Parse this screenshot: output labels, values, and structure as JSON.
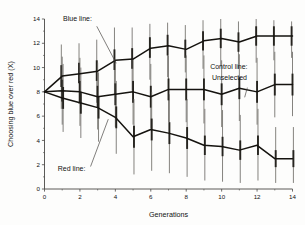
{
  "chart_data": {
    "type": "line",
    "title": "",
    "xlabel": "Generations",
    "ylabel": "Choosing blue over red (X)",
    "xlim": [
      0,
      14
    ],
    "ylim": [
      0,
      14
    ],
    "xticks": [
      0,
      2,
      4,
      6,
      8,
      10,
      12,
      14
    ],
    "yticks": [
      0,
      2,
      4,
      6,
      8,
      10,
      12,
      14
    ],
    "xtick_labels": [
      "0",
      "2",
      "4",
      "6",
      "8",
      "10",
      "12",
      "14"
    ],
    "ytick_labels": [
      "0",
      "2",
      "4",
      "6",
      "8",
      "10",
      "12",
      "14"
    ],
    "grid": false,
    "legend_position": "none",
    "x": [
      0,
      1,
      2,
      3,
      4,
      5,
      6,
      7,
      8,
      9,
      10,
      11,
      12,
      13,
      14
    ],
    "series": [
      {
        "name": "Blue line",
        "values": [
          8.0,
          9.3,
          9.5,
          9.7,
          10.6,
          10.7,
          11.6,
          11.8,
          11.5,
          12.2,
          12.4,
          12.1,
          12.6,
          12.6,
          12.6
        ],
        "err_lo": [
          8.0,
          6.6,
          7.0,
          7.1,
          7.8,
          8.1,
          9.0,
          9.2,
          9.6,
          9.9,
          10.1,
          9.9,
          10.4,
          10.6,
          10.8
        ],
        "err_hi": [
          8.0,
          11.9,
          12.0,
          12.3,
          13.3,
          13.3,
          13.6,
          13.7,
          13.5,
          13.9,
          14.0,
          13.8,
          14.0,
          13.9,
          13.8
        ],
        "se_lo": [
          8.0,
          8.4,
          8.7,
          8.9,
          9.8,
          9.9,
          10.8,
          11.0,
          10.8,
          11.4,
          11.6,
          11.3,
          11.8,
          11.8,
          11.8
        ],
        "se_hi": [
          8.0,
          10.2,
          10.4,
          10.6,
          11.5,
          11.6,
          12.5,
          12.7,
          12.3,
          13.0,
          13.2,
          12.9,
          13.4,
          13.4,
          13.4
        ]
      },
      {
        "name": "Control line: Unselected",
        "values": [
          8.0,
          8.1,
          8.0,
          7.6,
          7.8,
          8.0,
          7.6,
          8.2,
          8.2,
          8.2,
          7.8,
          8.3,
          8.0,
          8.6,
          8.6
        ],
        "err_lo": [
          8.0,
          5.3,
          5.2,
          4.9,
          5.1,
          5.3,
          5.0,
          5.5,
          5.5,
          5.4,
          5.1,
          5.6,
          5.3,
          5.9,
          6.0
        ],
        "err_hi": [
          8.0,
          10.9,
          10.8,
          10.4,
          10.6,
          10.8,
          10.3,
          11.0,
          11.0,
          11.0,
          10.6,
          11.1,
          10.8,
          11.3,
          11.3
        ],
        "se_lo": [
          8.0,
          7.2,
          7.1,
          6.7,
          6.9,
          7.1,
          6.7,
          7.3,
          7.3,
          7.3,
          6.9,
          7.4,
          7.1,
          7.7,
          7.7
        ],
        "se_hi": [
          8.0,
          9.0,
          8.9,
          8.5,
          8.7,
          8.9,
          8.5,
          9.1,
          9.1,
          9.1,
          8.7,
          9.2,
          8.9,
          9.5,
          9.5
        ]
      },
      {
        "name": "Red line",
        "values": [
          8.0,
          7.5,
          7.1,
          6.7,
          5.9,
          4.3,
          4.9,
          4.6,
          4.2,
          3.6,
          3.5,
          3.2,
          3.6,
          2.5,
          2.5
        ],
        "err_lo": [
          8.0,
          4.7,
          4.2,
          3.9,
          2.9,
          1.2,
          1.5,
          1.3,
          1.0,
          0.7,
          0.6,
          0.5,
          0.7,
          0.5,
          0.5
        ],
        "err_hi": [
          8.0,
          10.3,
          10.0,
          9.6,
          8.9,
          7.4,
          8.0,
          7.8,
          7.4,
          6.6,
          6.5,
          6.1,
          6.6,
          5.1,
          5.1
        ],
        "se_lo": [
          8.0,
          6.6,
          6.2,
          5.8,
          5.0,
          3.4,
          4.0,
          3.7,
          3.3,
          2.8,
          2.7,
          2.4,
          2.8,
          1.8,
          1.8
        ],
        "se_hi": [
          8.0,
          8.4,
          8.0,
          7.6,
          6.8,
          5.2,
          5.8,
          5.5,
          5.1,
          4.4,
          4.3,
          4.0,
          4.4,
          3.2,
          3.2
        ]
      }
    ],
    "annotations": [
      {
        "id": "blue-line",
        "text": "Blue line:",
        "x": 1.05,
        "y": 13.8,
        "anchor": "start",
        "leader": [
          [
            2.95,
            13.4
          ],
          [
            4.05,
            10.35
          ]
        ]
      },
      {
        "id": "red-line",
        "text": "Red line:",
        "x": 0.75,
        "y": 1.45,
        "anchor": "start",
        "leader": [
          [
            2.6,
            1.85
          ],
          [
            3.6,
            5.75
          ]
        ]
      },
      {
        "id": "control-line",
        "text": "Control line:",
        "x": 9.35,
        "y": 9.9,
        "anchor": "start",
        "leader": null
      },
      {
        "id": "control-line-2",
        "text": "Unselected",
        "x": 9.45,
        "y": 9.0,
        "anchor": "start",
        "leader": [
          [
            11.45,
            8.35
          ],
          [
            11.3,
            7.55
          ]
        ]
      }
    ],
    "colors": {
      "line": "#15130f",
      "errorbar": "#6f6d68",
      "errorbar_se": "#26241f",
      "axis": "#4a4845",
      "text": "#111111",
      "background": "#fdfdfc"
    }
  }
}
